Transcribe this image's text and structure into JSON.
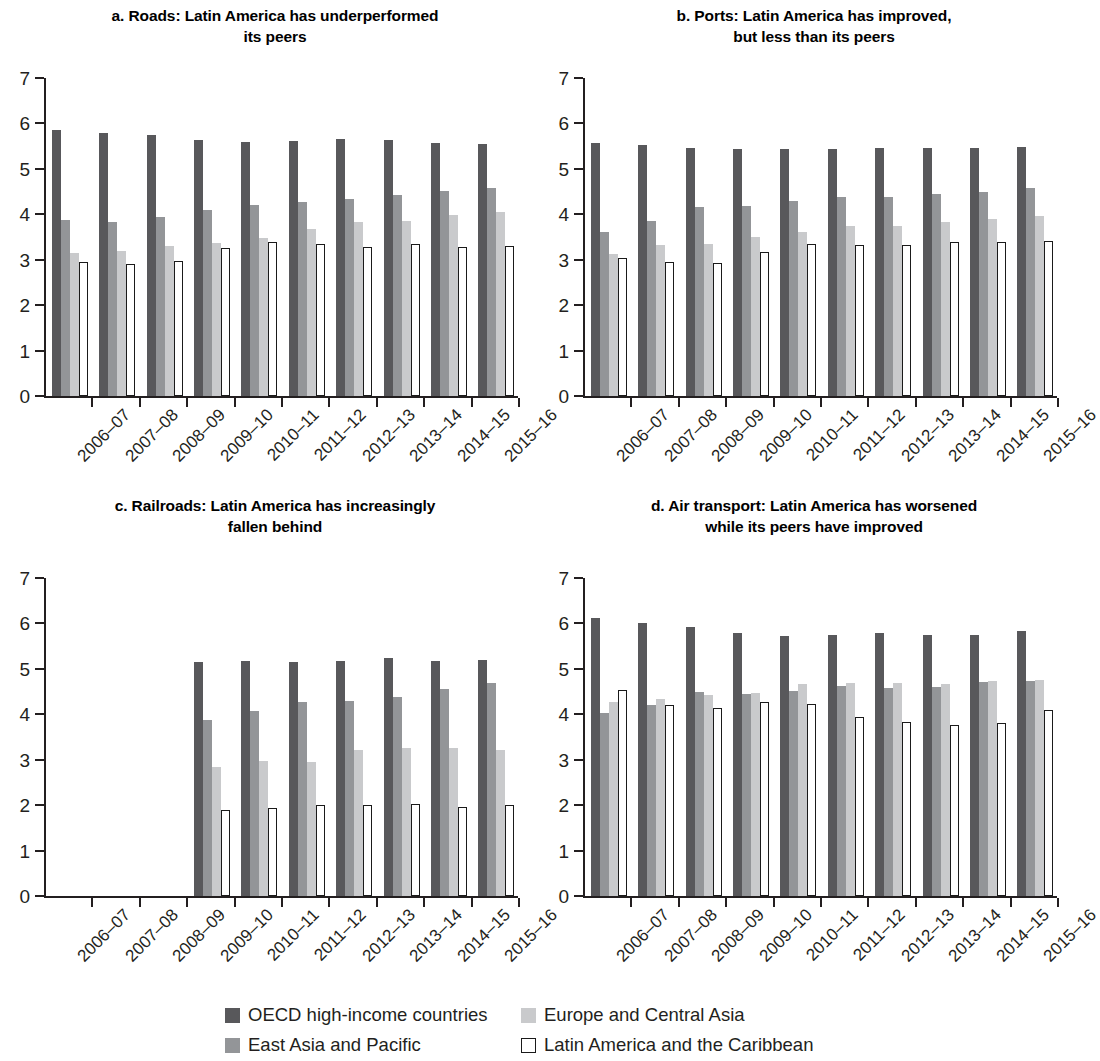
{
  "figure": {
    "panels": [
      {
        "key": "a",
        "title": "a. Roads: Latin America has underperformed\nits peers"
      },
      {
        "key": "b",
        "title": "b. Ports: Latin America has improved,\nbut less than its peers"
      },
      {
        "key": "c",
        "title": "c. Railroads: Latin America has increasingly\nfallen behind"
      },
      {
        "key": "d",
        "title": "d. Air transport: Latin America has worsened\nwhile its peers have improved"
      }
    ]
  },
  "legend": {
    "position": "bottom",
    "entries": [
      {
        "label": "OECD high-income countries",
        "color": "#58585b",
        "style": "filled"
      },
      {
        "label": "Europe and Central Asia",
        "color": "#c9cacc",
        "style": "filled"
      },
      {
        "label": "East Asia and Pacific",
        "color": "#939598",
        "style": "filled"
      },
      {
        "label": "Latin America and the Caribbean",
        "color": "#ffffff",
        "style": "outline"
      }
    ]
  },
  "chart_data": [
    {
      "type": "bar",
      "panel": "a",
      "title": "a. Roads: Latin America has underperformed its peers",
      "xlabel": "",
      "ylabel": "",
      "ylim": [
        0,
        7
      ],
      "yticks": [
        0,
        1,
        2,
        3,
        4,
        5,
        6,
        7
      ],
      "grid": false,
      "categories": [
        "2006–07",
        "2007–08",
        "2008–09",
        "2009–10",
        "2010–11",
        "2011–12",
        "2012–13",
        "2013–14",
        "2014–15",
        "2015–16"
      ],
      "series": [
        {
          "name": "OECD high-income countries",
          "color": "#58585b",
          "values": [
            5.85,
            5.8,
            5.75,
            5.63,
            5.6,
            5.62,
            5.66,
            5.64,
            5.58,
            5.55
          ]
        },
        {
          "name": "East Asia and Pacific",
          "color": "#939598",
          "values": [
            3.88,
            3.83,
            3.94,
            4.09,
            4.21,
            4.28,
            4.34,
            4.43,
            4.52,
            4.57
          ]
        },
        {
          "name": "Europe and Central Asia",
          "color": "#c9cacc",
          "values": [
            3.15,
            3.2,
            3.3,
            3.36,
            3.47,
            3.67,
            3.82,
            3.86,
            3.99,
            4.06
          ]
        },
        {
          "name": "Latin America and the Caribbean",
          "color": "#ffffff",
          "values": [
            2.96,
            2.9,
            2.98,
            3.26,
            3.38,
            3.34,
            3.28,
            3.35,
            3.29,
            3.31
          ]
        }
      ]
    },
    {
      "type": "bar",
      "panel": "b",
      "title": "b. Ports: Latin America has improved, but less than its peers",
      "xlabel": "",
      "ylabel": "",
      "ylim": [
        0,
        7
      ],
      "yticks": [
        0,
        1,
        2,
        3,
        4,
        5,
        6,
        7
      ],
      "grid": false,
      "categories": [
        "2006–07",
        "2007–08",
        "2008–09",
        "2009–10",
        "2010–11",
        "2011–12",
        "2012–13",
        "2013–14",
        "2014–15",
        "2015–16"
      ],
      "series": [
        {
          "name": "OECD high-income countries",
          "color": "#58585b",
          "values": [
            5.58,
            5.53,
            5.47,
            5.43,
            5.44,
            5.44,
            5.45,
            5.47,
            5.46,
            5.48
          ]
        },
        {
          "name": "East Asia and Pacific",
          "color": "#939598",
          "values": [
            3.62,
            3.86,
            4.17,
            4.18,
            4.29,
            4.39,
            4.38,
            4.44,
            4.5,
            4.57
          ]
        },
        {
          "name": "Europe and Central Asia",
          "color": "#c9cacc",
          "values": [
            3.13,
            3.32,
            3.34,
            3.49,
            3.6,
            3.74,
            3.75,
            3.82,
            3.9,
            3.96
          ]
        },
        {
          "name": "Latin America and the Caribbean",
          "color": "#ffffff",
          "values": [
            3.04,
            2.96,
            2.93,
            3.17,
            3.34,
            3.33,
            3.33,
            3.4,
            3.38,
            3.42
          ]
        }
      ]
    },
    {
      "type": "bar",
      "panel": "c",
      "title": "c. Railroads: Latin America has increasingly fallen behind",
      "xlabel": "",
      "ylabel": "",
      "ylim": [
        0,
        7
      ],
      "yticks": [
        0,
        1,
        2,
        3,
        4,
        5,
        6,
        7
      ],
      "grid": false,
      "categories": [
        "2006–07",
        "2007–08",
        "2008–09",
        "2009–10",
        "2010–11",
        "2011–12",
        "2012–13",
        "2013–14",
        "2014–15",
        "2015–16"
      ],
      "series": [
        {
          "name": "OECD high-income countries",
          "color": "#58585b",
          "values": [
            null,
            null,
            null,
            5.16,
            5.17,
            5.16,
            5.17,
            5.23,
            5.18,
            5.19
          ]
        },
        {
          "name": "East Asia and Pacific",
          "color": "#939598",
          "values": [
            null,
            null,
            null,
            3.87,
            4.08,
            4.27,
            4.29,
            4.39,
            4.56,
            4.69
          ]
        },
        {
          "name": "Europe and Central Asia",
          "color": "#c9cacc",
          "values": [
            null,
            null,
            null,
            2.84,
            2.98,
            2.96,
            3.21,
            3.26,
            3.25,
            3.22
          ]
        },
        {
          "name": "Latin America and the Caribbean",
          "color": "#ffffff",
          "values": [
            null,
            null,
            null,
            1.89,
            1.94,
            2.0,
            2.0,
            2.02,
            1.97,
            2.0
          ]
        }
      ]
    },
    {
      "type": "bar",
      "panel": "d",
      "title": "d. Air transport: Latin America has worsened while its peers have improved",
      "xlabel": "",
      "ylabel": "",
      "ylim": [
        0,
        7
      ],
      "yticks": [
        0,
        1,
        2,
        3,
        4,
        5,
        6,
        7
      ],
      "grid": false,
      "categories": [
        "2006–07",
        "2007–08",
        "2008–09",
        "2009–10",
        "2010–11",
        "2011–12",
        "2012–13",
        "2013–14",
        "2014–15",
        "2015–16"
      ],
      "series": [
        {
          "name": "OECD high-income countries",
          "color": "#58585b",
          "values": [
            6.11,
            6.01,
            5.93,
            5.79,
            5.72,
            5.75,
            5.78,
            5.74,
            5.74,
            5.83
          ]
        },
        {
          "name": "East Asia and Pacific",
          "color": "#939598",
          "values": [
            4.02,
            4.2,
            4.49,
            4.45,
            4.52,
            4.63,
            4.58,
            4.61,
            4.71,
            4.73
          ]
        },
        {
          "name": "Europe and Central Asia",
          "color": "#c9cacc",
          "values": [
            4.26,
            4.33,
            4.43,
            4.47,
            4.66,
            4.69,
            4.68,
            4.67,
            4.73,
            4.76
          ]
        },
        {
          "name": "Latin America and the Caribbean",
          "color": "#ffffff",
          "values": [
            4.53,
            4.21,
            4.13,
            4.28,
            4.22,
            3.93,
            3.84,
            3.77,
            3.8,
            4.1
          ]
        }
      ]
    }
  ]
}
